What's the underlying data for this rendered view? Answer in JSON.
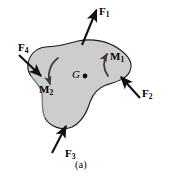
{
  "figure": {
    "caption": "(a)",
    "body": {
      "name": "rigid-body-blob",
      "fill_color": "#cdcdcd",
      "stroke_color": "#1a1a1a"
    },
    "center_of_gravity": {
      "label": "G",
      "marker": "dot",
      "x": 84,
      "y": 76
    },
    "forces": [
      {
        "id": "F1",
        "label": "F",
        "subscript": "1",
        "direction": "up-right",
        "points": "outward",
        "tail": [
          82,
          44
        ],
        "head": [
          97,
          8
        ]
      },
      {
        "id": "F2",
        "label": "F",
        "subscript": "2",
        "direction": "up-left",
        "points": "inward",
        "tail": [
          139,
          97
        ],
        "head": [
          119,
          76
        ]
      },
      {
        "id": "F3",
        "label": "F",
        "subscript": "3",
        "direction": "up-right",
        "points": "inward",
        "tail": [
          53,
          152
        ],
        "head": [
          67,
          124
        ]
      },
      {
        "id": "F4",
        "label": "F",
        "subscript": "4",
        "direction": "down-right",
        "points": "inward",
        "tail": [
          20,
          57
        ],
        "head": [
          41,
          76
        ]
      }
    ],
    "moments": [
      {
        "id": "M1",
        "label": "M",
        "subscript": "1",
        "sense": "counterclockwise",
        "arrow": "curved-up"
      },
      {
        "id": "M2",
        "label": "M",
        "subscript": "2",
        "sense": "clockwise",
        "arrow": "curved-down"
      }
    ],
    "colors": {
      "background": "#ffffff",
      "body_fill": "#cdcdcd",
      "outline": "#1a1a1a",
      "text": "#000000"
    }
  }
}
